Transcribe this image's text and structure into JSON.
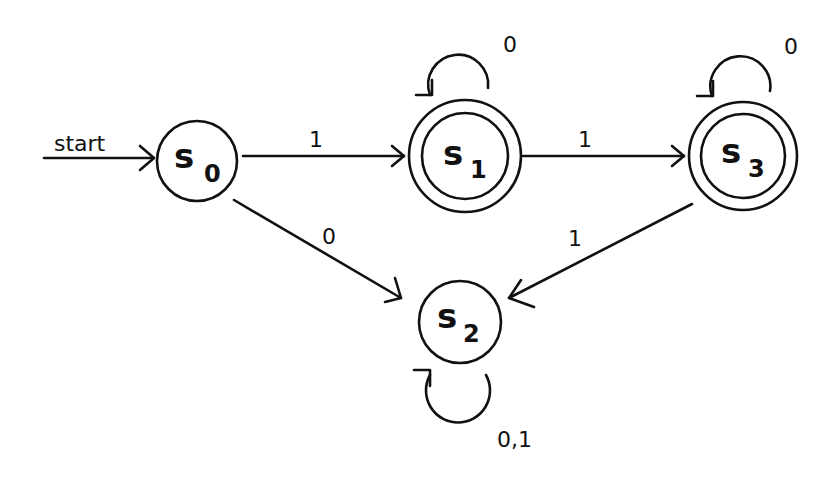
{
  "diagram": {
    "type": "finite-state-automaton",
    "start_label": "start",
    "states": [
      {
        "id": "s0",
        "letter": "s",
        "subscript": "0",
        "accepting": false
      },
      {
        "id": "s1",
        "letter": "s",
        "subscript": "1",
        "accepting": true
      },
      {
        "id": "s2",
        "letter": "s",
        "subscript": "2",
        "accepting": false
      },
      {
        "id": "s3",
        "letter": "s",
        "subscript": "3",
        "accepting": true
      }
    ],
    "transitions": [
      {
        "from": "s0",
        "to": "s1",
        "label": "1"
      },
      {
        "from": "s0",
        "to": "s2",
        "label": "0"
      },
      {
        "from": "s1",
        "to": "s1",
        "label": "0"
      },
      {
        "from": "s1",
        "to": "s3",
        "label": "1"
      },
      {
        "from": "s3",
        "to": "s3",
        "label": "0"
      },
      {
        "from": "s3",
        "to": "s2",
        "label": "1"
      },
      {
        "from": "s2",
        "to": "s2",
        "label": "0,1"
      }
    ]
  }
}
